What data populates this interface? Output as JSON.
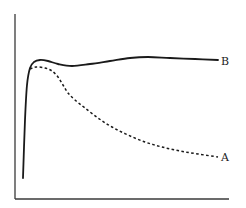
{
  "chart_data": {
    "type": "line",
    "title": "",
    "xlabel": "",
    "ylabel": "",
    "grid": false,
    "ticks": false,
    "legend_position": "inline-right-end",
    "series": [
      {
        "name": "B",
        "style": "solid",
        "color": "#1a1a1a",
        "label": "B",
        "points": [
          [
            23,
            178
          ],
          [
            25,
            120
          ],
          [
            27,
            85
          ],
          [
            30,
            68
          ],
          [
            34,
            62
          ],
          [
            40,
            60
          ],
          [
            48,
            61
          ],
          [
            58,
            64
          ],
          [
            72,
            66
          ],
          [
            90,
            64
          ],
          [
            110,
            61
          ],
          [
            130,
            58
          ],
          [
            148,
            57
          ],
          [
            170,
            58
          ],
          [
            195,
            59
          ],
          [
            218,
            60
          ]
        ]
      },
      {
        "name": "A",
        "style": "dashed",
        "color": "#1a1a1a",
        "label": "A",
        "points": [
          [
            30,
            69
          ],
          [
            36,
            67
          ],
          [
            45,
            68
          ],
          [
            52,
            71
          ],
          [
            58,
            77
          ],
          [
            63,
            85
          ],
          [
            68,
            93
          ],
          [
            75,
            100
          ],
          [
            85,
            108
          ],
          [
            98,
            118
          ],
          [
            112,
            127
          ],
          [
            128,
            135
          ],
          [
            145,
            142
          ],
          [
            162,
            147
          ],
          [
            180,
            151
          ],
          [
            198,
            154
          ],
          [
            218,
            157
          ]
        ]
      }
    ],
    "labels": {
      "B": "B",
      "A": "A"
    },
    "axes": {
      "y_axis": {
        "x": 15,
        "y_top": 14,
        "y_bottom": 199
      },
      "x_axis": {
        "y": 199,
        "x_left": 15,
        "x_right": 229
      }
    }
  }
}
